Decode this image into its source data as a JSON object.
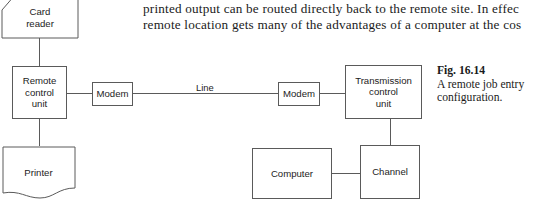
{
  "page": {
    "width": 554,
    "height": 203,
    "background": "#ffffff",
    "stroke_color": "#5a5a5a",
    "text_color": "#1c1c1c"
  },
  "prose": {
    "line_1": "printed output can be routed directly back to the remote site. In effec",
    "line_2": "remote location gets many of the advantages of a computer at the cos"
  },
  "caption": {
    "figure_number": "Fig. 16.14",
    "text": "A remote job entry configuration."
  },
  "diagram": {
    "nodes": [
      {
        "id": "card-reader",
        "label": "Card\nreader",
        "shape": "punched-card"
      },
      {
        "id": "remote-control-unit",
        "label": "Remote\ncontrol\nunit",
        "shape": "rect"
      },
      {
        "id": "printer",
        "label": "Printer",
        "shape": "paper"
      },
      {
        "id": "modem-left",
        "label": "Modem",
        "shape": "rect"
      },
      {
        "id": "modem-right",
        "label": "Modem",
        "shape": "rect"
      },
      {
        "id": "transmission-control-unit",
        "label": "Transmission\ncontrol\nunit",
        "shape": "rect"
      },
      {
        "id": "computer",
        "label": "Computer",
        "shape": "rect"
      },
      {
        "id": "channel",
        "label": "Channel",
        "shape": "rect"
      }
    ],
    "labels": {
      "card_reader_l1": "Card",
      "card_reader_l2": "reader",
      "remote_control_l1": "Remote",
      "remote_control_l2": "control",
      "remote_control_l3": "unit",
      "printer": "Printer",
      "modem_left": "Modem",
      "modem_right": "Modem",
      "transmission_l1": "Transmission",
      "transmission_l2": "control",
      "transmission_l3": "unit",
      "computer": "Computer",
      "channel": "Channel",
      "line": "Line"
    },
    "connections": [
      {
        "from": "card-reader",
        "to": "remote-control-unit",
        "label": ""
      },
      {
        "from": "remote-control-unit",
        "to": "printer",
        "label": ""
      },
      {
        "from": "remote-control-unit",
        "to": "modem-left",
        "label": ""
      },
      {
        "from": "modem-left",
        "to": "modem-right",
        "label": "Line"
      },
      {
        "from": "modem-right",
        "to": "transmission-control-unit",
        "label": ""
      },
      {
        "from": "transmission-control-unit",
        "to": "channel",
        "label": ""
      },
      {
        "from": "channel",
        "to": "computer",
        "label": ""
      }
    ]
  }
}
